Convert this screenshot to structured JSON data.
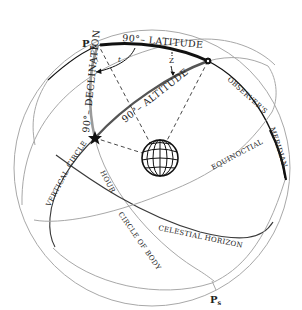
{
  "diagram": {
    "colors": {
      "background": "#ffffff",
      "thin_line": "#a8a8a8",
      "dark_line": "#3a3a3a",
      "thick_line": "#111111",
      "altitude_arc": "#555555",
      "text": "#222222"
    },
    "points": {
      "north_pole": {
        "label": "P",
        "subscript": "n"
      },
      "south_pole": {
        "label": "P",
        "subscript": "s"
      },
      "zenith": {
        "icon": "filled-dot"
      },
      "body": {
        "icon": "star"
      },
      "earth": {
        "icon": "globe"
      }
    },
    "arc_labels": {
      "colatitude": "90°– LATITUDE",
      "polar_distance": "90°– DECLINATION",
      "zenith_distance": "90°– ALTITUDE"
    },
    "angle_labels": {
      "meridian_angle": "t",
      "azimuth_angle": "Z"
    },
    "circle_labels": {
      "observers": "OBSERVER'S",
      "meridian": "MERIDIAN",
      "equinoctial": "EQUINOCTIAL",
      "vertical": "VERTICAL",
      "circle": "CIRCLE",
      "hour": "HOUR",
      "circle_of_body": "CIRCLE OF BODY",
      "celestial_horizon": "CELESTIAL HORIZON"
    }
  }
}
